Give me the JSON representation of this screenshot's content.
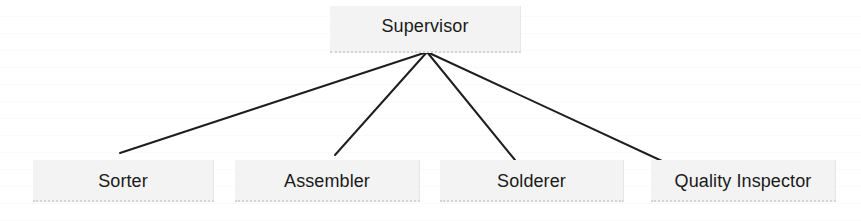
{
  "diagram": {
    "type": "org-chart",
    "root": {
      "label": "Supervisor"
    },
    "children": [
      {
        "label": "Sorter"
      },
      {
        "label": "Assembler"
      },
      {
        "label": "Solderer"
      },
      {
        "label": "Quality Inspector"
      }
    ],
    "edges": [
      {
        "from": "Supervisor",
        "to": "Sorter"
      },
      {
        "from": "Supervisor",
        "to": "Assembler"
      },
      {
        "from": "Supervisor",
        "to": "Solderer"
      },
      {
        "from": "Supervisor",
        "to": "Quality Inspector"
      }
    ],
    "colors": {
      "box_fill": "#f3f3f3",
      "line": "#1e1e1e",
      "text": "#1a1a1a",
      "background": "#ffffff"
    }
  }
}
